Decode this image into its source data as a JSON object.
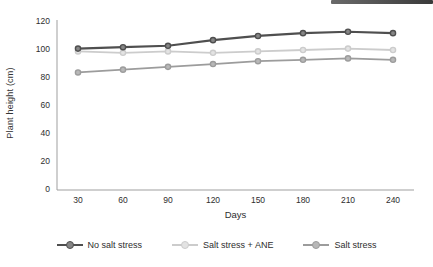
{
  "decor": {
    "top_right_bar_color": "#3a3a3a"
  },
  "chart_data": {
    "type": "line",
    "x": [
      30,
      60,
      90,
      120,
      150,
      180,
      210,
      240
    ],
    "xlabel": "Days",
    "ylabel": "Plant height (cm)",
    "ylim": [
      0,
      120
    ],
    "yticks": [
      0,
      20,
      40,
      60,
      80,
      100,
      120
    ],
    "grid": false,
    "legend_position": "bottom",
    "axis_color": "#9f9f9f",
    "tick_label_color": "#2e2e2e",
    "series": [
      {
        "name": "No salt stress",
        "color": "#4f4f4f",
        "marker_fill": "#868686",
        "values": [
          100,
          101,
          102,
          106,
          109,
          111,
          112,
          111
        ]
      },
      {
        "name": "Salt stress + ANE",
        "color": "#cccccc",
        "marker_fill": "#e3e3e3",
        "values": [
          98,
          97,
          98,
          97,
          98,
          99,
          100,
          99
        ]
      },
      {
        "name": "Salt stress",
        "color": "#9c9c9c",
        "marker_fill": "#b8b8b8",
        "values": [
          83,
          85,
          87,
          89,
          91,
          92,
          93,
          92
        ]
      }
    ]
  }
}
